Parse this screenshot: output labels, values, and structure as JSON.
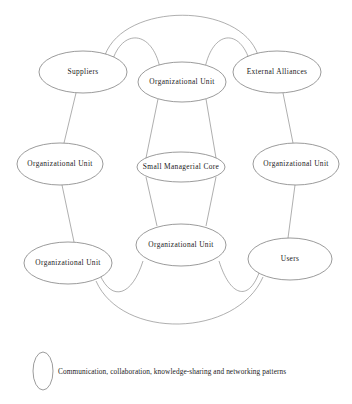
{
  "diagram": {
    "background_color": "#ffffff",
    "node_stroke_color": "#7a7a7a",
    "edge_stroke_color": "#8d8d8d",
    "text_color": "#1a1a1a",
    "nodes": [
      {
        "id": "suppliers",
        "label": "Suppliers",
        "cx": 83,
        "cy": 72,
        "rx": 44,
        "ry": 21
      },
      {
        "id": "top-center-unit",
        "label": "Organizational Unit",
        "cx": 182,
        "cy": 82,
        "rx": 44,
        "ry": 20
      },
      {
        "id": "external-alliances",
        "label": "External Alliances",
        "cx": 277,
        "cy": 72,
        "rx": 44,
        "ry": 21
      },
      {
        "id": "left-middle-unit",
        "label": "Organizational Unit",
        "cx": 60,
        "cy": 164,
        "rx": 43,
        "ry": 21
      },
      {
        "id": "managerial-core",
        "label": "Small Managerial Core",
        "cx": 181,
        "cy": 167,
        "rx": 44,
        "ry": 15
      },
      {
        "id": "right-middle-unit",
        "label": "Organizational Unit",
        "cx": 296,
        "cy": 164,
        "rx": 43,
        "ry": 21
      },
      {
        "id": "bottom-left-unit",
        "label": "Organizational Unit",
        "cx": 68,
        "cy": 263,
        "rx": 44,
        "ry": 21
      },
      {
        "id": "bottom-center-unit",
        "label": "Organizational Unit",
        "cx": 181,
        "cy": 245,
        "rx": 45,
        "ry": 21
      },
      {
        "id": "users",
        "label": "Users",
        "cx": 290,
        "cy": 259,
        "rx": 42,
        "ry": 21
      }
    ],
    "legend": {
      "text": "Communication, collaboration, knowledge-sharing and networking patterns",
      "symbol": "ellipse-outline",
      "symbol_cx": 43,
      "symbol_cy": 371,
      "symbol_rx": 10,
      "symbol_ry": 19,
      "text_x": 58,
      "text_y": 372
    },
    "edges": [
      {
        "id": "arc-suppliers-external-top",
        "kind": "arc",
        "from": "suppliers",
        "to": "external-alliances",
        "d": "M 105 55 C 125 2 240 2 258 55"
      },
      {
        "id": "arc-suppliers-topcenter",
        "kind": "arc",
        "from": "suppliers",
        "to": "top-center-unit",
        "d": "M 112 62 C 122 28 152 30 160 68"
      },
      {
        "id": "arc-topcenter-external",
        "kind": "arc",
        "from": "top-center-unit",
        "to": "external-alliances",
        "d": "M 205 68 C 213 30 240 28 250 62"
      },
      {
        "id": "line-suppliers-leftmiddle",
        "kind": "line",
        "from": "suppliers",
        "to": "left-middle-unit",
        "d": "M 76 93 L 64 143"
      },
      {
        "id": "line-external-rightmiddle",
        "kind": "line",
        "from": "external-alliances",
        "to": "right-middle-unit",
        "d": "M 283 93 L 293 143"
      },
      {
        "id": "line-topcenter-core-left",
        "kind": "line",
        "from": "top-center-unit",
        "to": "managerial-core",
        "d": "M 158 99 L 146 158"
      },
      {
        "id": "line-topcenter-core-right",
        "kind": "line",
        "from": "top-center-unit",
        "to": "managerial-core",
        "d": "M 206 99 L 216 158"
      },
      {
        "id": "line-core-bottomcenter-left",
        "kind": "line",
        "from": "managerial-core",
        "to": "bottom-center-unit",
        "d": "M 146 177 L 157 226"
      },
      {
        "id": "line-core-bottomcenter-right",
        "kind": "line",
        "from": "managerial-core",
        "to": "bottom-center-unit",
        "d": "M 216 177 L 206 226"
      },
      {
        "id": "line-leftmiddle-bottomleft",
        "kind": "line",
        "from": "left-middle-unit",
        "to": "bottom-left-unit",
        "d": "M 62 185 L 74 242"
      },
      {
        "id": "line-rightmiddle-users",
        "kind": "line",
        "from": "right-middle-unit",
        "to": "users",
        "d": "M 295 185 L 288 238"
      },
      {
        "id": "arc-bottomleft-bottomcenter",
        "kind": "arc",
        "from": "bottom-left-unit",
        "to": "bottom-center-unit",
        "d": "M 100 275 C 112 302 132 296 143 261"
      },
      {
        "id": "arc-bottomcenter-users",
        "kind": "arc",
        "from": "bottom-center-unit",
        "to": "users",
        "d": "M 219 261 C 230 296 248 302 259 273"
      },
      {
        "id": "arc-bottomleft-users",
        "kind": "arc",
        "from": "bottom-left-unit",
        "to": "users",
        "d": "M 96 281 C 122 340 236 338 263 277"
      }
    ]
  }
}
